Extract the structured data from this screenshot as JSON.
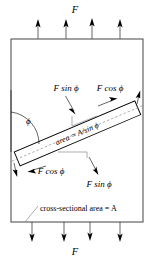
{
  "figure": {
    "background_color": "#ffffff",
    "line_color": "#000000",
    "box_color": "#555555",
    "dashed_color": "#888888"
  },
  "labels": {
    "force_top": "F",
    "force_bottom": "F",
    "normal_component_upper": "F sin ϕ",
    "shear_component_upper": "F cos ϕ",
    "shear_component_lower": "F cos ϕ",
    "normal_component_lower": "F sin ϕ",
    "angle": "ϕ",
    "inclined_area": "area = A/sin ϕ",
    "cross_section": "cross-sectional area = A"
  },
  "geometry": {
    "box": {
      "x": 11,
      "y": 39,
      "width": 132,
      "height": 183
    },
    "top_arrows_x": [
      38,
      66,
      92,
      120
    ],
    "top_arrow_tail_y": 39,
    "top_arrow_head_y": 21,
    "bottom_arrows_x": [
      32,
      64,
      90,
      120
    ],
    "bottom_arrow_tail_y": 222,
    "bottom_arrow_head_y": 242,
    "bar_angle_degrees": 23,
    "bar_start": {
      "x": 16,
      "y": 159
    },
    "bar_end": {
      "x": 138,
      "y": 108
    }
  },
  "icons": {
    "force_arrow": "up-arrow-icon",
    "force_arrow_down": "down-arrow-icon",
    "component_arrow": "vector-arrow-icon",
    "angle_arc": "angle-arc-icon",
    "leader_line": "leader-line-icon"
  }
}
